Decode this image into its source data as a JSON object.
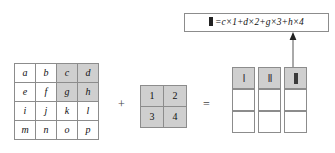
{
  "diagram": {
    "operators": {
      "plus": "+",
      "equals": "="
    },
    "colors": {
      "shaded_cell": "#cfcfcf",
      "cell_border": "#8c8c8c",
      "background": "#ffffff",
      "text": "#111111",
      "arrow": "#555555"
    }
  },
  "input_matrix": {
    "name": "input-feature-map",
    "rows": 4,
    "cols": 4,
    "cells": [
      [
        {
          "label": "a",
          "shaded": false
        },
        {
          "label": "b",
          "shaded": false
        },
        {
          "label": "c",
          "shaded": true
        },
        {
          "label": "d",
          "shaded": true
        }
      ],
      [
        {
          "label": "e",
          "shaded": false
        },
        {
          "label": "f",
          "shaded": false
        },
        {
          "label": "g",
          "shaded": true
        },
        {
          "label": "h",
          "shaded": true
        }
      ],
      [
        {
          "label": "i",
          "shaded": false
        },
        {
          "label": "j",
          "shaded": false
        },
        {
          "label": "k",
          "shaded": false
        },
        {
          "label": "l",
          "shaded": false
        }
      ],
      [
        {
          "label": "m",
          "shaded": false
        },
        {
          "label": "n",
          "shaded": false
        },
        {
          "label": "o",
          "shaded": false
        },
        {
          "label": "p",
          "shaded": false
        }
      ]
    ]
  },
  "kernel_matrix": {
    "name": "convolution-kernel",
    "rows": 2,
    "cols": 2,
    "cells": [
      [
        {
          "label": "1",
          "shaded": true
        },
        {
          "label": "2",
          "shaded": true
        }
      ],
      [
        {
          "label": "3",
          "shaded": true
        },
        {
          "label": "4",
          "shaded": true
        }
      ]
    ]
  },
  "output_columns": [
    {
      "name": "output-column-1",
      "cells": [
        {
          "mark": "I",
          "thick": false,
          "shaded": true
        },
        {
          "mark": "",
          "thick": false,
          "shaded": false
        },
        {
          "mark": "",
          "thick": false,
          "shaded": false
        }
      ]
    },
    {
      "name": "output-column-2",
      "cells": [
        {
          "mark": "II",
          "thick": false,
          "shaded": true
        },
        {
          "mark": "",
          "thick": false,
          "shaded": false
        },
        {
          "mark": "",
          "thick": false,
          "shaded": false
        }
      ]
    },
    {
      "name": "output-column-3",
      "cells": [
        {
          "mark": "",
          "thick": true,
          "shaded": true
        },
        {
          "mark": "",
          "thick": false,
          "shaded": false
        },
        {
          "mark": "",
          "thick": false,
          "shaded": false
        }
      ]
    }
  ],
  "formula": {
    "name": "output-formula-callout",
    "lead_symbol": "thick-bar",
    "expression": "=c×1+d×2+g×3+h×4",
    "full_text": "▮ = c×1 + d×2 + g×3 + h×4"
  }
}
